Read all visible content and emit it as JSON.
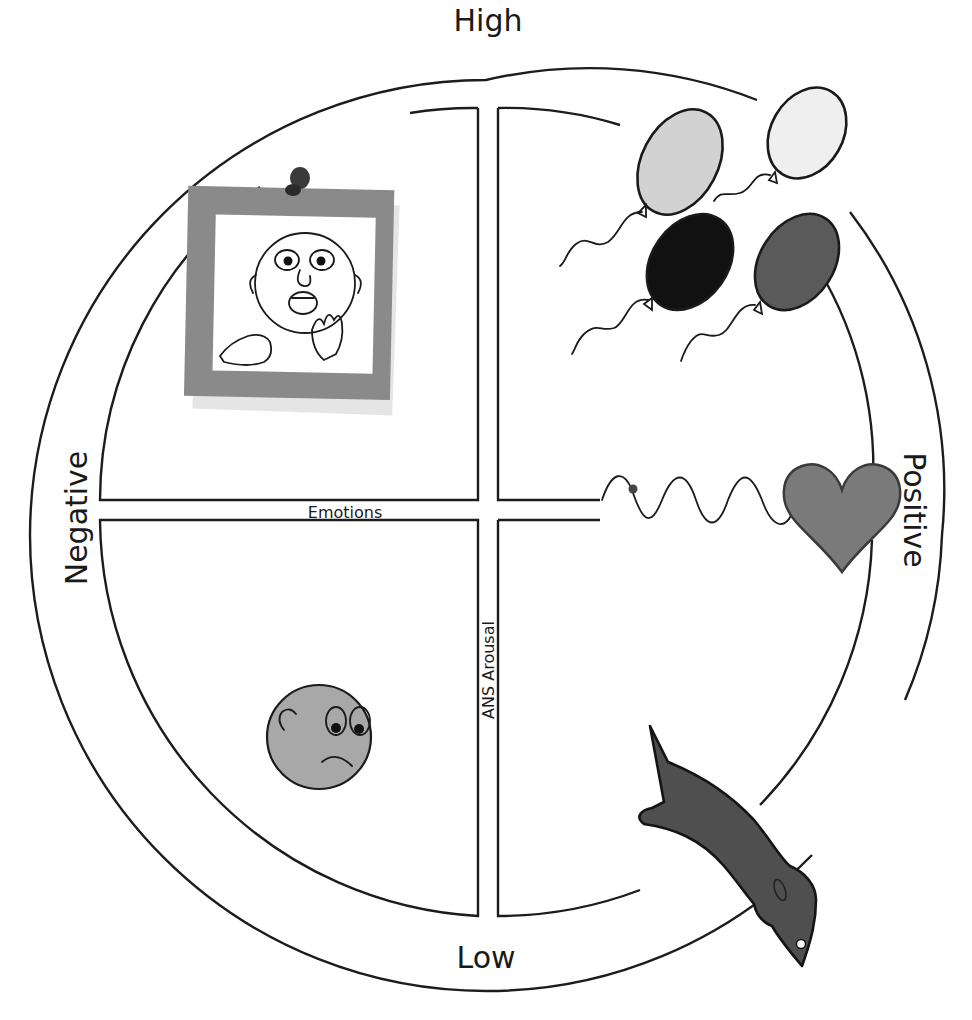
{
  "diagram": {
    "type": "emotion-circumplex",
    "axes": {
      "vertical": {
        "label": "ANS Arousal",
        "top": "High",
        "bottom": "Low"
      },
      "horizontal": {
        "label": "Emotions",
        "left": "Negative",
        "right": "Positive"
      }
    },
    "labels": {
      "high": "High",
      "low": "Low",
      "negative": "Negative",
      "positive": "Positive",
      "emotions": "Emotions",
      "arousal": "ANS Arousal"
    },
    "quadrants": [
      {
        "position": "top-left",
        "valence": "Negative",
        "arousal": "High",
        "illustration": "frightened-face-sticky-note"
      },
      {
        "position": "top-right",
        "valence": "Positive",
        "arousal": "High",
        "illustration": "balloons"
      },
      {
        "position": "bottom-left",
        "valence": "Negative",
        "arousal": "Low",
        "illustration": "sad-face"
      },
      {
        "position": "bottom-right",
        "valence": "Positive",
        "arousal": "Low",
        "illustration": "dead-fish"
      }
    ],
    "extra_illustrations": [
      {
        "name": "heartbeat-heart",
        "position": "right-middle"
      }
    ],
    "colors": {
      "line": "#1c1c1c",
      "note_frame": "#8a8a8a",
      "balloon_light": "#d2d2d2",
      "balloon_lighter": "#efefef",
      "balloon_black": "#111111",
      "balloon_dark": "#5a5a5a",
      "heart": "#7a7a7a",
      "sad_face": "#a8a8a8",
      "fish": "#4f4f4f"
    }
  }
}
